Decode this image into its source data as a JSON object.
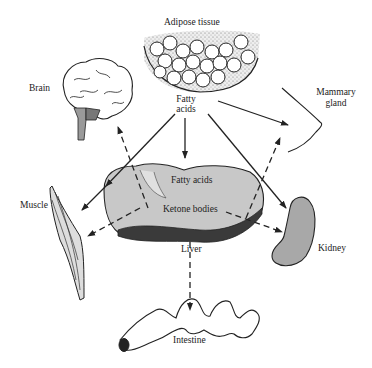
{
  "diagram": {
    "labels": {
      "adipose": "Adipose tissue",
      "fatty_acids_top_1": "Fatty",
      "fatty_acids_top_2": "acids",
      "brain": "Brain",
      "mammary_1": "Mammary",
      "mammary_2": "gland",
      "muscle": "Muscle",
      "liver_fatty_acids": "Fatty acids",
      "liver_ketone_bodies": "Ketone bodies",
      "liver": "Liver",
      "kidney": "Kidney",
      "intestine": "Intestine"
    },
    "legend": {
      "solid_arrow": "Fatty acids flow",
      "dashed_arrow": "Ketone bodies flow"
    },
    "colors": {
      "line": "#222222",
      "liver_fill": "#c8c8c8",
      "liver_dark": "#3a3a3a",
      "kidney_fill": "#a8a8a8",
      "brain_stem": "#9a9a9a",
      "background": "#ffffff"
    }
  }
}
